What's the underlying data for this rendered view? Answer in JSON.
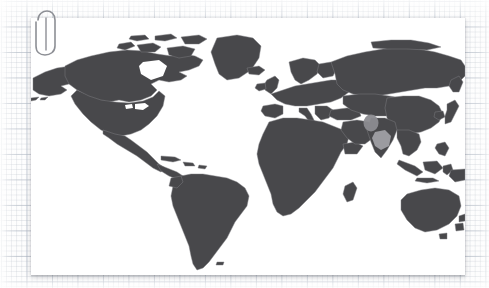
{
  "scene": {
    "kind": "photo-of-printed-world-map",
    "background": "grid-graph-paper",
    "card_label": "world-map-print"
  },
  "colors": {
    "paper": "#fdfdfd",
    "grid_minor": "#96a0af",
    "grid_major": "#7887 9b",
    "card": "#ffffff",
    "land": "#3f3f42",
    "land_border": "#6f6f74",
    "ocean": "#ffffff",
    "highlight": "#85858a",
    "highlight_secondary": "#9a9a9f",
    "clip": "#8d8f95",
    "shadow": "#5a5f69"
  },
  "map": {
    "title": "World Map",
    "projection": "equirectangular",
    "land_fill": "#3f3f42",
    "ocean_fill": "#ffffff",
    "borders_visible": true,
    "graticule_visible": false,
    "continents": [
      "North America",
      "South America",
      "Europe",
      "Africa",
      "Asia",
      "Oceania"
    ],
    "highlights": [
      {
        "name": "asia-highlight-north",
        "label": "Highlighted region (Central / South Asia)",
        "shape": "blob",
        "color": "#85858a"
      },
      {
        "name": "asia-highlight-south",
        "label": "Highlighted region (Indochina / SE Asia)",
        "shape": "blob",
        "color": "#9a9a9f"
      }
    ]
  },
  "clip": {
    "label": "Paperclip",
    "icon": "paperclip-icon",
    "color": "#8d8f95"
  }
}
